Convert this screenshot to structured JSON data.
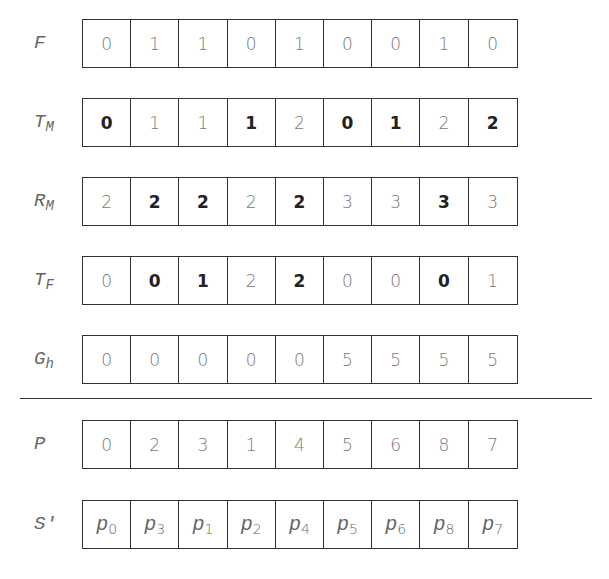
{
  "figure": {
    "rows": [
      {
        "id": "F",
        "label": "F",
        "sub": "",
        "top": 19,
        "values": [
          "0",
          "1",
          "1",
          "0",
          "1",
          "0",
          "0",
          "1",
          "0"
        ],
        "bold": [
          false,
          false,
          false,
          false,
          false,
          false,
          false,
          false,
          false
        ]
      },
      {
        "id": "T_M",
        "label": "T",
        "sub": "M",
        "top": 98,
        "values": [
          "0",
          "1",
          "1",
          "1",
          "2",
          "0",
          "1",
          "2",
          "2"
        ],
        "bold": [
          true,
          false,
          false,
          true,
          false,
          true,
          true,
          false,
          true
        ]
      },
      {
        "id": "R_M",
        "label": "R",
        "sub": "M",
        "top": 177,
        "values": [
          "2",
          "2",
          "2",
          "2",
          "2",
          "3",
          "3",
          "3",
          "3"
        ],
        "bold": [
          false,
          true,
          true,
          false,
          true,
          false,
          false,
          true,
          false
        ]
      },
      {
        "id": "T_F",
        "label": "T",
        "sub": "F",
        "top": 256,
        "values": [
          "0",
          "0",
          "1",
          "2",
          "2",
          "0",
          "0",
          "0",
          "1"
        ],
        "bold": [
          false,
          true,
          true,
          false,
          true,
          false,
          false,
          true,
          false
        ]
      },
      {
        "id": "G_h",
        "label": "G",
        "sub": "h",
        "top": 335,
        "values": [
          "0",
          "0",
          "0",
          "0",
          "0",
          "5",
          "5",
          "5",
          "5"
        ],
        "bold": [
          false,
          false,
          false,
          false,
          false,
          false,
          false,
          false,
          false
        ]
      },
      {
        "id": "P",
        "label": "P",
        "sub": "",
        "top": 420,
        "values": [
          "0",
          "2",
          "3",
          "1",
          "4",
          "5",
          "6",
          "8",
          "7"
        ],
        "bold": [
          false,
          false,
          false,
          false,
          false,
          false,
          false,
          false,
          false
        ]
      }
    ],
    "s_prime": {
      "label": "S′",
      "top": 500,
      "cells": [
        {
          "sym": "p",
          "sub": "0"
        },
        {
          "sym": "p",
          "sub": "3"
        },
        {
          "sym": "p",
          "sub": "1"
        },
        {
          "sym": "p",
          "sub": "2"
        },
        {
          "sym": "p",
          "sub": "4"
        },
        {
          "sym": "p",
          "sub": "5"
        },
        {
          "sym": "p",
          "sub": "6"
        },
        {
          "sym": "p",
          "sub": "8"
        },
        {
          "sym": "p",
          "sub": "7"
        }
      ]
    },
    "colors": {
      "border": "#333333",
      "text_normal": "#777777",
      "text_bold": "#222222",
      "background": "#ffffff"
    }
  }
}
